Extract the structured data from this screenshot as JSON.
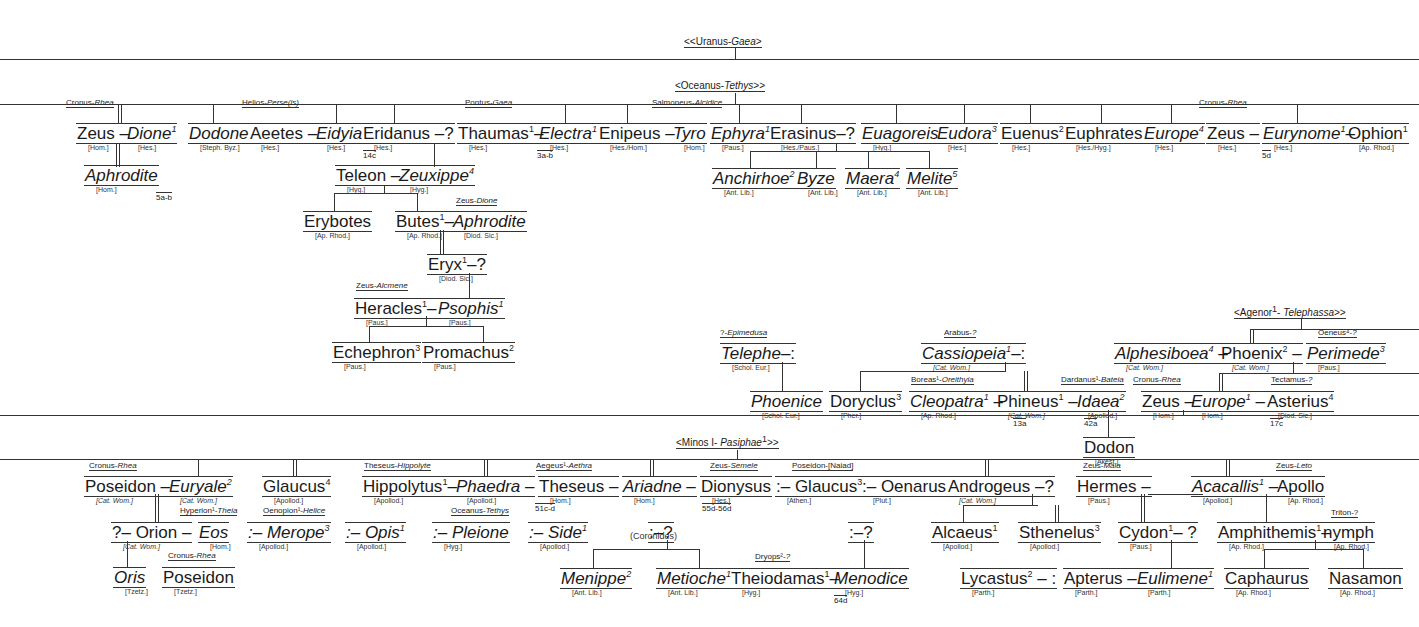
{
  "roots": {
    "uranus": {
      "label_a": "<<Uranus-",
      "label_b": "Gaea",
      "label_c": ">"
    },
    "oceanus": {
      "label_a": "<Oceanus-",
      "label_b": "Tethys",
      "label_c": ">>"
    },
    "agenor": {
      "label_a": "<Agenor",
      "sup": "1",
      "label_m": "- ",
      "label_b": "Telephassa",
      "label_c": ">>"
    },
    "minos": {
      "label_a": "<Minos I- ",
      "label_b": "Pasiphae",
      "sup": "1",
      "label_c": ">>"
    }
  },
  "nodes": [
    {
      "id": "zeus1",
      "name": "Zeus",
      "sep": " – ",
      "italic": false,
      "x": 76,
      "y": 123,
      "src": "[Hom.]",
      "parents_a": "Cronus-",
      "parents_b": "Rhea",
      "px": 66,
      "py": 98
    },
    {
      "id": "dione",
      "name": "Dione",
      "sup": "1",
      "italic": true,
      "x": 126,
      "y": 123,
      "src": "[Hes.]"
    },
    {
      "id": "aphrodite1",
      "name": "Aphrodite",
      "italic": true,
      "x": 84,
      "y": 165,
      "src": "[Hom.]",
      "ref": "5a-b"
    },
    {
      "id": "dodone",
      "name": "Dodone",
      "italic": true,
      "x": 188,
      "y": 123,
      "src": "[Steph. Byz.]"
    },
    {
      "id": "aeetes",
      "name": "Aeetes",
      "sep": " – ",
      "italic": false,
      "x": 249,
      "y": 123,
      "src": "[Hes.]",
      "parents_a": "Helios-",
      "parents_b": "Perse(is)",
      "px": 242,
      "py": 98
    },
    {
      "id": "eidyia",
      "name": "Eidyia",
      "italic": true,
      "x": 315,
      "y": 123,
      "src": "[Hes.]",
      "ref": "14c"
    },
    {
      "id": "eridanus",
      "name": "Eridanus",
      "sep": " –?",
      "italic": false,
      "x": 362,
      "y": 123,
      "src": "[Hes.]"
    },
    {
      "id": "teleon",
      "name": "Teleon",
      "sep": " – ",
      "italic": false,
      "x": 335,
      "y": 165,
      "src": "[Hyg.]"
    },
    {
      "id": "zeuxippe",
      "name": "Zeuxippe",
      "sup": "4",
      "italic": true,
      "x": 398,
      "y": 165,
      "src": "[Hyg.]"
    },
    {
      "id": "erybotes",
      "name": "Erybotes",
      "italic": false,
      "x": 303,
      "y": 211,
      "src": "[Ap. Rhod.]"
    },
    {
      "id": "butes",
      "name": "Butes",
      "sup": "1",
      "sep": "– ",
      "italic": false,
      "x": 395,
      "y": 211,
      "src": "[Ap. Rhod.]"
    },
    {
      "id": "aphrodite2",
      "name": "Aphrodite",
      "italic": true,
      "x": 452,
      "y": 211,
      "src": "[Diod. Sic.]",
      "parents_a": "Zeus-",
      "parents_b": "Dione",
      "px": 456,
      "py": 196
    },
    {
      "id": "eryx",
      "name": "Eryx",
      "sup": "1",
      "sep": "–?",
      "italic": false,
      "x": 427,
      "y": 254,
      "src": "[Diod. Sic.]"
    },
    {
      "id": "heracles",
      "name": "Heracles",
      "sup": "1",
      "sep": "– ",
      "italic": false,
      "x": 354,
      "y": 298,
      "src": "[Paus.]",
      "parents_a": "Zeus-",
      "parents_b": "Alcmene",
      "px": 356,
      "py": 281
    },
    {
      "id": "psophis",
      "name": "Psophis",
      "sup": "1",
      "italic": true,
      "x": 437,
      "y": 298,
      "src": "[Paus.]"
    },
    {
      "id": "echephron",
      "name": "Echephron",
      "sup": "3",
      "italic": false,
      "x": 332,
      "y": 342,
      "src": "[Paus.]"
    },
    {
      "id": "promachus",
      "name": "Promachus",
      "sup": "2",
      "italic": false,
      "x": 422,
      "y": 342,
      "src": "[Paus.]"
    },
    {
      "id": "thaumas",
      "name": "Thaumas",
      "sup": "1",
      "sep": "– ",
      "italic": false,
      "x": 457,
      "y": 123,
      "src": "[Hes.]",
      "parents_a": "Pontus-",
      "parents_b": "Gaea",
      "px": 465,
      "py": 98,
      "ref": "3a-b"
    },
    {
      "id": "electra",
      "name": "Electra",
      "sup": "1",
      "italic": true,
      "x": 538,
      "y": 123,
      "src": "[Hes.]"
    },
    {
      "id": "enipeus",
      "name": "Enipeus",
      "sep": " – ",
      "italic": false,
      "x": 598,
      "y": 123,
      "src": "[Hes./Hom.]"
    },
    {
      "id": "tyro",
      "name": "Tyro",
      "italic": true,
      "x": 672,
      "y": 123,
      "src": "[Hom.]",
      "parents_a": "Salmoneus-",
      "parents_b": "Alcidice",
      "px": 652,
      "py": 98
    },
    {
      "id": "ephyra",
      "name": "Ephyra",
      "sup": "1",
      "italic": true,
      "x": 710,
      "y": 123,
      "src": "[Paus.]"
    },
    {
      "id": "erasinus",
      "name": "Erasinus",
      "sep": "–?",
      "italic": false,
      "x": 769,
      "y": 123,
      "src": "[Hes./Paus.]"
    },
    {
      "id": "euagoreis",
      "name": "Euagoreis",
      "italic": true,
      "x": 861,
      "y": 123,
      "src": "[Hyg.]"
    },
    {
      "id": "eudora",
      "name": "Eudora",
      "sup": "3",
      "italic": true,
      "x": 936,
      "y": 123,
      "src": "[Hes.]"
    },
    {
      "id": "euenus",
      "name": "Euenus",
      "sup": "2",
      "italic": false,
      "x": 1000,
      "y": 123,
      "src": "[Hes.]"
    },
    {
      "id": "euphrates",
      "name": "Euphrates",
      "italic": false,
      "x": 1064,
      "y": 123,
      "src": "[Hes./Hyg.]"
    },
    {
      "id": "europe1",
      "name": "Europe",
      "sup": "4",
      "italic": true,
      "x": 1143,
      "y": 123,
      "src": "[Hes.]"
    },
    {
      "id": "zeus2",
      "name": "Zeus",
      "sep": " – ",
      "italic": false,
      "x": 1206,
      "y": 123,
      "src": "[Hes.]",
      "parents_a": "Cronus-",
      "parents_b": "Rhea",
      "px": 1199,
      "py": 98,
      "ref": "5d"
    },
    {
      "id": "eurynome",
      "name": "Eurynome",
      "sup": "1",
      "sep": "– ",
      "italic": true,
      "x": 1262,
      "y": 123,
      "src": "[Hes.]"
    },
    {
      "id": "ophion",
      "name": "Ophion",
      "sup": "1",
      "italic": false,
      "x": 1347,
      "y": 123,
      "src": "[Ap. Rhod.]"
    },
    {
      "id": "anchirhoe",
      "name": "Anchirhoe",
      "sup": "2",
      "italic": true,
      "x": 712,
      "y": 168,
      "src": "[Ant. Lib.]"
    },
    {
      "id": "byze",
      "name": "Byze",
      "italic": true,
      "x": 796,
      "y": 168,
      "src": "[Ant. Lib.]"
    },
    {
      "id": "maera",
      "name": "Maera",
      "sup": "4",
      "italic": true,
      "x": 845,
      "y": 168,
      "src": "[Ant. Lib.]"
    },
    {
      "id": "melite",
      "name": "Melite",
      "sup": "5",
      "italic": true,
      "x": 906,
      "y": 168,
      "src": "[Ant. Lib.]"
    },
    {
      "id": "telephe",
      "name": "Telephe",
      "sep": "–:",
      "italic": true,
      "x": 720,
      "y": 343,
      "src": "[Schol. Eur.]",
      "parents_a": "?-",
      "parents_b": "Epimedusa",
      "px": 720,
      "py": 328
    },
    {
      "id": "phoenice",
      "name": "Phoenice",
      "italic": true,
      "x": 750,
      "y": 391,
      "src": "[Schol. Eur.]"
    },
    {
      "id": "doryclus",
      "name": "Doryclus",
      "sup": "3",
      "italic": false,
      "x": 829,
      "y": 391,
      "src": "[Pher.]"
    },
    {
      "id": "cassiopeia",
      "name": "Cassiopeia",
      "sup": "1",
      "sep": "–:",
      "italic": true,
      "x": 921,
      "y": 343,
      "src": "[Cat. Wom.]",
      "src_italic": true,
      "parents_a": "Arabus-",
      "parents_b": "?",
      "px": 944,
      "py": 328
    },
    {
      "id": "cleopatra",
      "name": "Cleopatra",
      "sup": "1",
      "sep": " – ",
      "italic": true,
      "x": 909,
      "y": 391,
      "src": "[Ap. Rhod.]",
      "parents_a": "Boreas¹-",
      "parents_b": "Oreithyia",
      "px": 911,
      "py": 375,
      "ref": "13a"
    },
    {
      "id": "phineus",
      "name": "Phineus",
      "sup": "1",
      "sep": " – ",
      "italic": false,
      "x": 996,
      "y": 391,
      "src": "[Cat. Wom.]",
      "src_italic": true,
      "ref": "42a"
    },
    {
      "id": "idaea",
      "name": "Idaea",
      "sup": "2",
      "italic": true,
      "x": 1076,
      "y": 391,
      "src": "[Apollod.]",
      "parents_a": "Dardanus¹-",
      "parents_b": "Bateia",
      "px": 1061,
      "py": 375
    },
    {
      "id": "dodon",
      "name": "Dodon",
      "italic": false,
      "x": 1083,
      "y": 437,
      "src": "[Akest.]"
    },
    {
      "id": "alphesiboea",
      "name": "Alphesiboea",
      "sup": "4",
      "sep": " – ",
      "italic": true,
      "x": 1114,
      "y": 343,
      "src": "[Cat. Wom.]",
      "src_italic": true
    },
    {
      "id": "phoenix",
      "name": "Phoenix",
      "sup": "2",
      "sep": " – ",
      "italic": false,
      "x": 1220,
      "y": 343,
      "src": "[Cat. Wom.]",
      "src_italic": true
    },
    {
      "id": "perimede",
      "name": "Perimede",
      "sup": "3",
      "italic": true,
      "x": 1306,
      "y": 343,
      "src": "[Paus.]",
      "parents_a": "Oeneus⁴-",
      "parents_b": "?",
      "px": 1318,
      "py": 328
    },
    {
      "id": "zeus3",
      "name": "Zeus",
      "sep": " – ",
      "italic": false,
      "x": 1141,
      "y": 391,
      "src": "[Hom.]",
      "parents_a": "Cronus-",
      "parents_b": "Rhea",
      "px": 1133,
      "py": 375
    },
    {
      "id": "europe2",
      "name": "Europe",
      "sup": "1",
      "sep": " – ",
      "italic": true,
      "x": 1190,
      "y": 391,
      "src": "[Hom.]",
      "ref": "17c"
    },
    {
      "id": "asterius",
      "name": "Asterius",
      "sup": "4",
      "italic": false,
      "x": 1266,
      "y": 391,
      "src": "[Diod. Sic.]",
      "parents_a": "Tectamus-",
      "parents_b": "?",
      "px": 1271,
      "py": 375
    },
    {
      "id": "poseidon1",
      "name": "Poseidon",
      "sep": " – ",
      "italic": false,
      "x": 84,
      "y": 476,
      "src": "[Cat. Wom.]",
      "src_italic": true,
      "parents_a": "Cronus-",
      "parents_b": "Rhea",
      "px": 89,
      "py": 461
    },
    {
      "id": "euryale",
      "name": "Euryale",
      "sup": "2",
      "italic": true,
      "x": 168,
      "y": 476,
      "src": "[Cat. Wom.]",
      "src_italic": true
    },
    {
      "id": "glaucus4",
      "name": "Glaucus",
      "sup": "4",
      "italic": false,
      "x": 262,
      "y": 476,
      "src": "[Apollod.]"
    },
    {
      "id": "orion",
      "name": "?– Orion",
      "sep": " – ",
      "italic": false,
      "x": 111,
      "y": 522,
      "src": "[Cat. Wom.]",
      "src_italic": true
    },
    {
      "id": "eos",
      "name": "Eos",
      "italic": true,
      "x": 198,
      "y": 522,
      "src": "[Hom.]",
      "parents_a": "Hyperion¹-",
      "parents_b": "Theia",
      "px": 180,
      "py": 506
    },
    {
      "id": "merope",
      "name": ":– Merope",
      "sup": "3",
      "italic": true,
      "x": 247,
      "y": 522,
      "src": "[Apollod.]",
      "parents_a": "Oenopion¹-",
      "parents_b": "Helice",
      "px": 263,
      "py": 506
    },
    {
      "id": "oris",
      "name": "Oris",
      "italic": true,
      "x": 113,
      "y": 567,
      "src": "[Tzetz.]"
    },
    {
      "id": "poseidon2",
      "name": "Poseidon",
      "italic": false,
      "x": 162,
      "y": 567,
      "src": "[Tzetz.]",
      "parents_a": "Cronus-",
      "parents_b": "Rhea",
      "px": 168,
      "py": 551
    },
    {
      "id": "hippolytus",
      "name": "Hippolytus",
      "sup": "1",
      "sep": "– ",
      "italic": false,
      "x": 362,
      "y": 476,
      "src": "[Apollod.]",
      "parents_a": "Theseus-",
      "parents_b": "Hippolyte",
      "px": 364,
      "py": 461
    },
    {
      "id": "phaedra",
      "name": "Phaedra",
      "sep": " – ",
      "italic": true,
      "x": 455,
      "y": 476,
      "src": "[Apollod.]",
      "ref": "51c-d"
    },
    {
      "id": "theseus",
      "name": "Theseus",
      "sep": " – ",
      "italic": false,
      "x": 538,
      "y": 476,
      "src": "[Hom.]",
      "parents_a": "Aegeus¹-",
      "parents_b": "Aethra",
      "px": 536,
      "py": 461
    },
    {
      "id": "ariadne",
      "name": "Ariadne",
      "sep": " – ",
      "italic": true,
      "x": 622,
      "y": 476,
      "src": "[Hom.]",
      "ref": "55d-56d"
    },
    {
      "id": "dionysus",
      "name": "Dionysus",
      "italic": false,
      "x": 700,
      "y": 476,
      "src": "[Hes.]",
      "parents_a": "Zeus-",
      "parents_b": "Semele",
      "px": 710,
      "py": 461
    },
    {
      "id": "glaucus3",
      "name": ":– Glaucus",
      "sup": "3",
      "italic": false,
      "x": 775,
      "y": 476,
      "src": "[Athen.]",
      "parents_a": "Poseidon-",
      "parents_b": "[Naiad]",
      "px": 792,
      "py": 461,
      "parents_plain": true
    },
    {
      "id": "oenarus",
      "name": ":– Oenarus",
      "italic": false,
      "x": 861,
      "y": 476,
      "src": "[Plut.]"
    },
    {
      "id": "opis",
      "name": ":– Opis",
      "sup": "1",
      "italic": true,
      "x": 345,
      "y": 522,
      "src": "[Apollod.]"
    },
    {
      "id": "pleione",
      "name": ":– Pleione",
      "italic": true,
      "x": 432,
      "y": 522,
      "src": "[Hyg.]",
      "parents_a": "Oceanus-",
      "parents_b": "Tethys",
      "px": 451,
      "py": 506
    },
    {
      "id": "side",
      "name": ":– Side",
      "sup": "1",
      "italic": true,
      "x": 528,
      "y": 522,
      "src": "[Apollod.]"
    },
    {
      "id": "unknown1",
      "name": ":–?",
      "italic": false,
      "x": 648,
      "y": 522,
      "src": ""
    },
    {
      "id": "menippe",
      "name": "Menippe",
      "sup": "2",
      "italic": true,
      "x": 560,
      "y": 568,
      "src": "[Ant. Lib.]"
    },
    {
      "id": "metioche",
      "name": "Metioche",
      "sup": "1",
      "italic": true,
      "x": 656,
      "y": 568,
      "src": "[Ant. Lib.]"
    },
    {
      "id": "theiodamas",
      "name": "Theiodamas",
      "sup": "1",
      "sep": "– ",
      "italic": false,
      "x": 730,
      "y": 568,
      "src": "[Hyg.]",
      "parents_a": "Dryops²-",
      "parents_b": "?",
      "px": 755,
      "py": 552,
      "ref": "64d"
    },
    {
      "id": "menodice",
      "name": "Menodice",
      "italic": true,
      "x": 833,
      "y": 568,
      "src": "[Hyg.]"
    },
    {
      "id": "unknown2",
      "name": ":–?",
      "italic": false,
      "x": 848,
      "y": 522,
      "src": ""
    },
    {
      "id": "androgeus",
      "name": "Androgeus",
      "sep": " –?",
      "italic": false,
      "x": 947,
      "y": 476,
      "src": "[Cat. Wom.]",
      "src_italic": true
    },
    {
      "id": "alcaeus",
      "name": "Alcaeus",
      "sup": "1",
      "italic": false,
      "x": 931,
      "y": 522,
      "src": "[Apollod.]"
    },
    {
      "id": "sthenelus",
      "name": "Sthenelus",
      "sup": "3",
      "italic": false,
      "x": 1018,
      "y": 522,
      "src": "[Apollod.]"
    },
    {
      "id": "lycastus",
      "name": "Lycastus",
      "sup": "2",
      "sep": " – :",
      "italic": false,
      "x": 960,
      "y": 568,
      "src": "[Parth.]"
    },
    {
      "id": "hermes",
      "name": "Hermes",
      "sep": " –",
      "italic": false,
      "x": 1076,
      "y": 476,
      "src": "[Paus.]",
      "parents_a": "Zeus-",
      "parents_b": "Maia",
      "px": 1083,
      "py": 461
    },
    {
      "id": "cydon",
      "name": "Cydon",
      "sup": "1",
      "sep": "– ?",
      "italic": false,
      "x": 1118,
      "y": 522,
      "src": "[Paus.]"
    },
    {
      "id": "apterus",
      "name": "Apterus",
      "sep": " – ",
      "italic": false,
      "x": 1063,
      "y": 568,
      "src": "[Parth.]"
    },
    {
      "id": "eulimene",
      "name": "Eulimene",
      "sup": "1",
      "italic": true,
      "x": 1136,
      "y": 568,
      "src": "[Parth.]"
    },
    {
      "id": "acacallis",
      "name": "Acacallis",
      "sup": "1",
      "sep": " – ",
      "italic": true,
      "x": 1191,
      "y": 476,
      "src": "[Apollod.]"
    },
    {
      "id": "apollo",
      "name": "Apollo",
      "italic": false,
      "x": 1276,
      "y": 476,
      "src": "[Ap. Rhod.]",
      "parents_a": "Zeus-",
      "parents_b": "Leto",
      "px": 1276,
      "py": 461
    },
    {
      "id": "amphithemis",
      "name": "Amphithemis",
      "sup": "1",
      "sep": "–",
      "italic": false,
      "x": 1217,
      "y": 522,
      "src": "[Ap. Rhod.]"
    },
    {
      "id": "nymph",
      "name": "nymph",
      "italic": false,
      "x": 1322,
      "y": 522,
      "src": "[Ap. Rhod.]",
      "parents_a": "Triton-",
      "parents_b": "?",
      "px": 1331,
      "py": 508,
      "parents_plain": true
    },
    {
      "id": "caphaurus",
      "name": "Caphaurus",
      "italic": false,
      "x": 1224,
      "y": 568,
      "src": "[Ap. Rhod.]"
    },
    {
      "id": "nasamon",
      "name": "Nasamon",
      "italic": false,
      "x": 1328,
      "y": 568,
      "src": "[Ap. Rhod.]"
    }
  ],
  "annotations": {
    "coronides": "(Coronides)"
  }
}
